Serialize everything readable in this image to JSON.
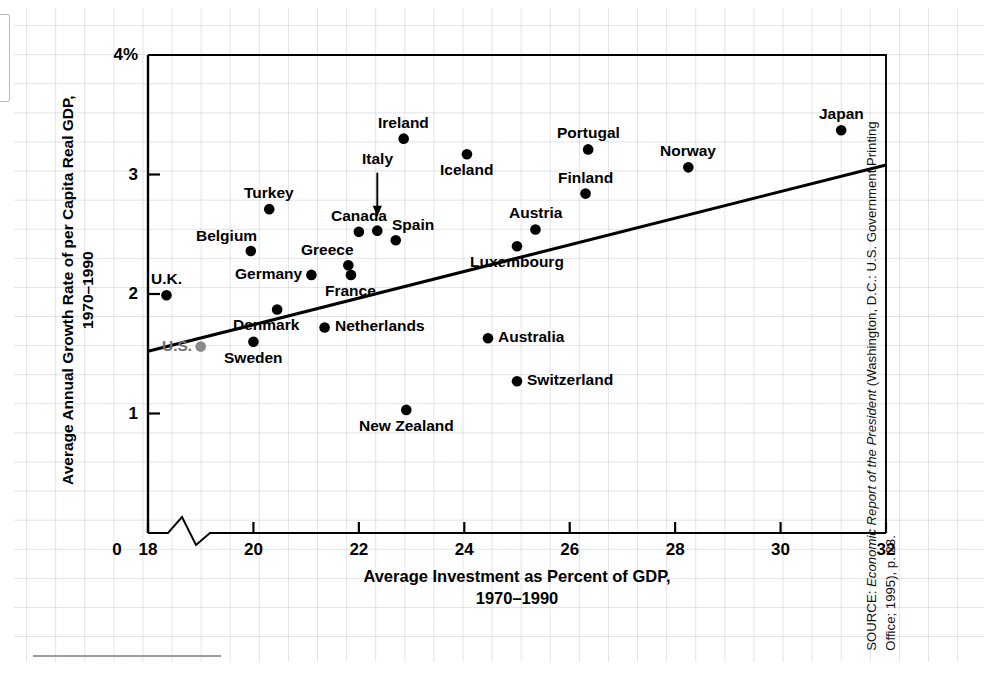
{
  "figure": {
    "x_axis_title_line1": "Average Investment as Percent of GDP,",
    "x_axis_title_line2": "1970–1990",
    "y_axis_title_line1": "Average Annual Growth Rate of per Capita Real GDP,",
    "y_axis_title_line2": "1970–1990",
    "source_prefix": "SOURCE: ",
    "source_italic": "Economic Report of the President",
    "source_rest": " (Washington, D.C.: U.S. Government Printing Office; 1995), p. 28."
  },
  "chart_data": {
    "type": "scatter",
    "title": "",
    "xlabel": "Average Investment as Percent of GDP, 1970–1990",
    "ylabel": "Average Annual Growth Rate of per Capita Real GDP, 1970–1990",
    "xlim": [
      18,
      32
    ],
    "ylim": [
      0,
      4
    ],
    "x_ticks": [
      "0",
      "18",
      "20",
      "22",
      "24",
      "26",
      "28",
      "30",
      "32"
    ],
    "x_tick_values": [
      0,
      18,
      20,
      22,
      24,
      26,
      28,
      30,
      32
    ],
    "y_ticks": [
      "1",
      "2",
      "3",
      "4%"
    ],
    "y_tick_values": [
      1,
      2,
      3,
      4
    ],
    "axis_break": true,
    "grid": true,
    "legend": "none",
    "points": [
      {
        "label": "U.K.",
        "x": 18.35,
        "y": 1.99,
        "label_pos": "above",
        "color": "#000000"
      },
      {
        "label": "U.S.",
        "x": 19.0,
        "y": 1.56,
        "label_pos": "left",
        "color": "#8a8a8a"
      },
      {
        "label": "Belgium",
        "x": 19.95,
        "y": 2.36,
        "label_pos": "above-left",
        "color": "#000000"
      },
      {
        "label": "Sweden",
        "x": 20.0,
        "y": 1.6,
        "label_pos": "below",
        "color": "#000000"
      },
      {
        "label": "Turkey",
        "x": 20.3,
        "y": 2.71,
        "label_pos": "above",
        "color": "#000000"
      },
      {
        "label": "Denmark",
        "x": 20.45,
        "y": 1.87,
        "label_pos": "below-left",
        "color": "#000000"
      },
      {
        "label": "Germany",
        "x": 21.1,
        "y": 2.16,
        "label_pos": "left",
        "color": "#000000"
      },
      {
        "label": "Netherlands",
        "x": 21.35,
        "y": 1.72,
        "label_pos": "right",
        "color": "#000000"
      },
      {
        "label": "Greece",
        "x": 21.8,
        "y": 2.24,
        "label_pos": "above-left",
        "color": "#000000"
      },
      {
        "label": "France",
        "x": 21.85,
        "y": 2.16,
        "label_pos": "below",
        "color": "#000000"
      },
      {
        "label": "Canada",
        "x": 22.0,
        "y": 2.52,
        "label_pos": "above",
        "color": "#000000"
      },
      {
        "label": "Italy",
        "x": 22.35,
        "y": 2.53,
        "label_pos": "arrow-above",
        "color": "#000000"
      },
      {
        "label": "Spain",
        "x": 22.7,
        "y": 2.45,
        "label_pos": "above-right",
        "color": "#000000"
      },
      {
        "label": "Ireland",
        "x": 22.85,
        "y": 3.3,
        "label_pos": "above",
        "color": "#000000"
      },
      {
        "label": "New Zealand",
        "x": 22.9,
        "y": 1.03,
        "label_pos": "below",
        "color": "#000000"
      },
      {
        "label": "Iceland",
        "x": 24.05,
        "y": 3.17,
        "label_pos": "below",
        "color": "#000000"
      },
      {
        "label": "Australia",
        "x": 24.45,
        "y": 1.63,
        "label_pos": "right",
        "color": "#000000"
      },
      {
        "label": "Switzerland",
        "x": 25.0,
        "y": 1.27,
        "label_pos": "right",
        "color": "#000000"
      },
      {
        "label": "Luxembourg",
        "x": 25.0,
        "y": 2.4,
        "label_pos": "below",
        "color": "#000000"
      },
      {
        "label": "Austria",
        "x": 25.35,
        "y": 2.54,
        "label_pos": "above",
        "color": "#000000"
      },
      {
        "label": "Finland",
        "x": 26.3,
        "y": 2.84,
        "label_pos": "above",
        "color": "#000000"
      },
      {
        "label": "Portugal",
        "x": 26.35,
        "y": 3.21,
        "label_pos": "above",
        "color": "#000000"
      },
      {
        "label": "Norway",
        "x": 28.25,
        "y": 3.06,
        "label_pos": "above",
        "color": "#000000"
      },
      {
        "label": "Japan",
        "x": 31.15,
        "y": 3.37,
        "label_pos": "above",
        "color": "#000000"
      }
    ],
    "trendline": {
      "x0": 18,
      "y0": 1.52,
      "x1": 32,
      "y1": 3.08,
      "color": "#000000"
    }
  }
}
